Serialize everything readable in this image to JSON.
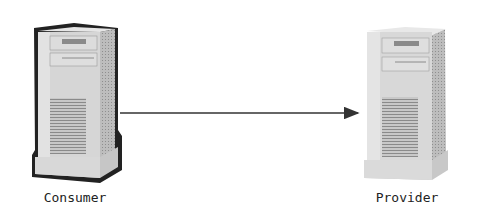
{
  "diagram": {
    "nodes": [
      {
        "id": "consumer",
        "label": "Consumer",
        "icon": "server-tower-icon",
        "selected": true
      },
      {
        "id": "provider",
        "label": "Provider",
        "icon": "server-tower-icon",
        "selected": false
      }
    ],
    "edges": [
      {
        "from": "consumer",
        "to": "provider",
        "style": "solid-arrow"
      }
    ],
    "colors": {
      "selection_outline": "#111111",
      "edge": "#333333",
      "tower_front": "#d4d4d4",
      "tower_side": "#b8b8b8"
    }
  }
}
